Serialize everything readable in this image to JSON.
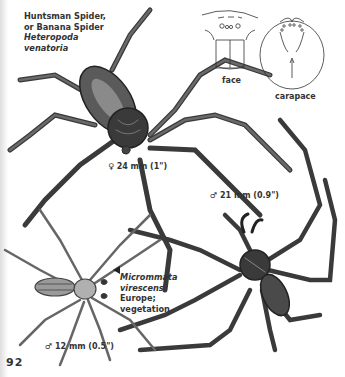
{
  "page": {
    "number": "92"
  },
  "species": [
    {
      "common_name_1": "Huntsman Spider,",
      "common_name_2": "or Banana Spider",
      "scientific_name_1": "Heteropoda",
      "scientific_name_2": "venatoria",
      "female_size": "♀ 24 mm (1\")",
      "male_size": "♂ 21 mm (0.9\")"
    },
    {
      "scientific_name_1": "Micrommata",
      "scientific_name_2": "virescens",
      "range": "Europe;",
      "habitat": "vegetation",
      "male_size": "♂ 12 mm (0.5\")"
    }
  ],
  "diagrams": {
    "face_label": "face",
    "carapace_label": "carapace"
  },
  "colors": {
    "ink": "#2a2a2a",
    "paper": "#ffffff"
  }
}
